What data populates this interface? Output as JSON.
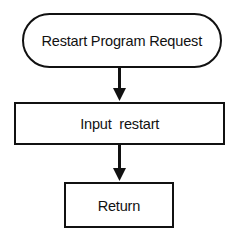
{
  "diagram": {
    "background_color": "#ffffff",
    "stroke_color": "#111111",
    "text_color": "#111111",
    "nodes": [
      {
        "id": "start",
        "shape": "terminal-rounded",
        "label": "Restart Program Request"
      },
      {
        "id": "process",
        "shape": "rectangle",
        "label": "Input  restart"
      },
      {
        "id": "return",
        "shape": "rectangle",
        "label": "Return"
      }
    ],
    "connectors": [
      {
        "id": "start-to-process",
        "from": "start",
        "to": "process",
        "direction": "down",
        "arrowhead": "filled-triangle"
      },
      {
        "id": "process-to-return",
        "from": "process",
        "to": "return",
        "direction": "down",
        "arrowhead": "filled-triangle"
      }
    ]
  }
}
